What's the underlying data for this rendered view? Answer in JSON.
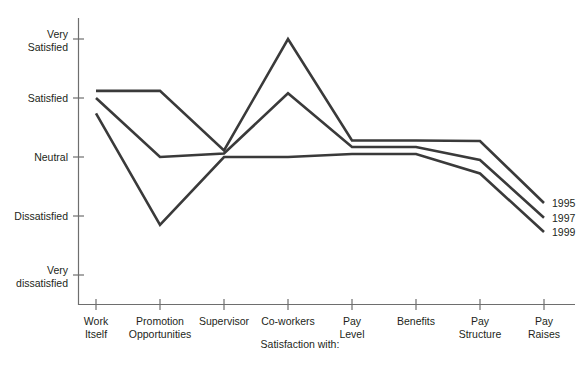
{
  "chart_data": {
    "type": "line",
    "title": "",
    "xlabel": "Satisfaction with:",
    "ylabel": "",
    "categories": [
      "Work Itself",
      "Promotion Opportunities",
      "Supervisor",
      "Co-workers",
      "Pay Level",
      "Benefits",
      "Pay Structure",
      "Pay Raises"
    ],
    "category_lines": [
      [
        "Work",
        "Itself"
      ],
      [
        "Promotion",
        "Opportunities"
      ],
      [
        "Supervisor",
        ""
      ],
      [
        "Co-workers",
        ""
      ],
      [
        "Pay",
        "Level"
      ],
      [
        "Benefits",
        ""
      ],
      [
        "Pay",
        "Structure"
      ],
      [
        "Pay",
        "Raises"
      ]
    ],
    "y_tick_labels": [
      [
        "Very",
        "Satisfied"
      ],
      [
        "Satisfied",
        ""
      ],
      [
        "Neutral",
        ""
      ],
      [
        "Dissatisfied",
        ""
      ],
      [
        "Very",
        "dissatisfied"
      ]
    ],
    "y_tick_values": [
      5,
      4,
      3,
      2,
      1
    ],
    "ylim": [
      0.6,
      5.4
    ],
    "grid": false,
    "legend_position": "right-end-of-lines",
    "series": [
      {
        "name": "1995",
        "color": "#3a3a3a",
        "values": [
          4.12,
          4.12,
          3.11,
          5.0,
          3.28,
          3.28,
          3.27,
          2.22
        ]
      },
      {
        "name": "1997",
        "color": "#3a3a3a",
        "values": [
          4.0,
          3.0,
          3.06,
          4.08,
          3.17,
          3.17,
          2.95,
          1.97
        ]
      },
      {
        "name": "1999",
        "color": "#3a3a3a",
        "values": [
          3.74,
          1.85,
          3.0,
          3.0,
          3.05,
          3.05,
          2.72,
          1.73
        ]
      }
    ]
  },
  "corner": {
    "mark": ""
  }
}
